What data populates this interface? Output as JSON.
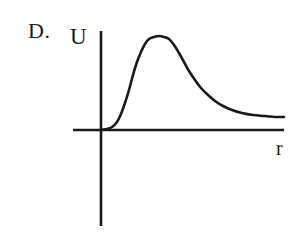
{
  "figure": {
    "option_label": "D.",
    "background_color": "#ffffff",
    "ink_color": "#1a1a1a",
    "axes": {
      "y_axis_label": "U",
      "x_axis_label": "r",
      "origin": [
        101,
        130
      ],
      "y_axis_top": [
        101,
        31
      ],
      "y_axis_bottom": [
        101,
        226
      ],
      "x_axis_left": [
        73,
        130
      ],
      "x_axis_right": [
        284,
        130
      ],
      "axis_line_width": 2.6
    },
    "curve": {
      "stroke_width": 2.6,
      "stroke_color": "#1a1a1a"
    }
  },
  "chart_data": {
    "type": "line",
    "title": "",
    "subtitle": "",
    "xlabel": "r",
    "ylabel": "U",
    "grid": false,
    "legend": null,
    "annotations": [
      "D."
    ],
    "axis_ticks": {
      "x": [],
      "y": []
    },
    "xlim": [
      73,
      284
    ],
    "ylim": [
      31,
      226
    ],
    "series": [
      {
        "name": "U(r)",
        "points_px": [
          [
            101,
            130
          ],
          [
            107,
            129
          ],
          [
            112,
            127
          ],
          [
            117,
            122
          ],
          [
            121,
            114
          ],
          [
            125,
            103
          ],
          [
            129,
            90
          ],
          [
            133,
            75
          ],
          [
            137,
            62
          ],
          [
            141,
            52
          ],
          [
            145,
            44
          ],
          [
            149,
            39
          ],
          [
            154,
            37
          ],
          [
            159,
            36
          ],
          [
            164,
            37
          ],
          [
            169,
            39
          ],
          [
            174,
            45
          ],
          [
            179,
            53
          ],
          [
            184,
            62
          ],
          [
            189,
            71
          ],
          [
            195,
            80
          ],
          [
            201,
            88
          ],
          [
            208,
            95
          ],
          [
            215,
            101
          ],
          [
            223,
            106
          ],
          [
            232,
            110
          ],
          [
            242,
            113
          ],
          [
            253,
            115
          ],
          [
            265,
            116
          ],
          [
            275,
            117
          ],
          [
            284,
            117
          ]
        ],
        "x_normalized": [
          0.0,
          0.03,
          0.06,
          0.09,
          0.11,
          0.13,
          0.15,
          0.17,
          0.2,
          0.22,
          0.24,
          0.26,
          0.29,
          0.32,
          0.34,
          0.37,
          0.4,
          0.43,
          0.45,
          0.48,
          0.51,
          0.55,
          0.58,
          0.62,
          0.67,
          0.72,
          0.77,
          0.83,
          0.9,
          0.95,
          1.0
        ],
        "y_normalized": [
          0.0,
          0.01,
          0.03,
          0.08,
          0.17,
          0.29,
          0.43,
          0.59,
          0.72,
          0.83,
          0.91,
          0.97,
          0.99,
          1.0,
          0.99,
          0.97,
          0.91,
          0.82,
          0.73,
          0.63,
          0.53,
          0.45,
          0.37,
          0.31,
          0.26,
          0.21,
          0.18,
          0.16,
          0.15,
          0.14,
          0.14
        ]
      }
    ]
  }
}
